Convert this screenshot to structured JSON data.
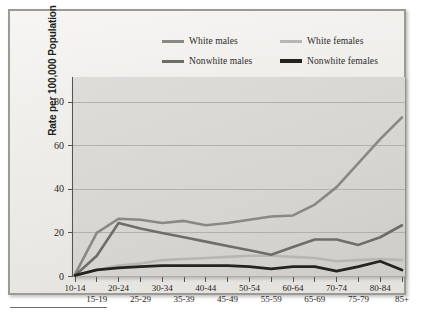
{
  "figure": {
    "y_axis_title": "Rate per 100,000 Population",
    "y_ticks": [
      "0",
      "20",
      "40",
      "60",
      "80"
    ],
    "colors": {
      "white_males": "#8a8885",
      "white_females": "#b8b6b2",
      "nonwhite_males": "#6f6d6a",
      "nonwhite_females": "#24231f",
      "plot_background": "#d6d4d0",
      "panel_background": "#eceae6",
      "panel_border": "#9b9a97",
      "gridline": "#a9a7a3",
      "axis": "#55534f",
      "text": "#272624"
    }
  },
  "legend": {
    "entries": [
      {
        "label": "White males",
        "color": "#8a8885",
        "width": 3.2
      },
      {
        "label": "White females",
        "color": "#b8b6b2",
        "width": 3.2
      },
      {
        "label": "Nonwhite males",
        "color": "#6f6d6a",
        "width": 3.4
      },
      {
        "label": "Nonwhite females",
        "color": "#24231f",
        "width": 4.0
      }
    ]
  },
  "chart_data": {
    "type": "line",
    "title": "",
    "xlabel": "",
    "ylabel": "Rate per 100,000 Population",
    "ylim": [
      0,
      86
    ],
    "yticks": [
      0,
      20,
      40,
      60,
      80
    ],
    "grid": true,
    "legend_position": "top-center",
    "categories": [
      "10-14",
      "15-19",
      "20-24",
      "25-29",
      "30-34",
      "35-39",
      "40-44",
      "45-49",
      "50-54",
      "55-59",
      "60-64",
      "65-69",
      "70-74",
      "75-79",
      "80-84",
      "85+"
    ],
    "series": [
      {
        "name": "White males",
        "color": "#8a8885",
        "values": [
          1,
          20,
          26.5,
          26,
          24.5,
          25.5,
          23.5,
          24.5,
          26,
          27.5,
          28,
          33,
          41,
          52,
          63,
          73
        ]
      },
      {
        "name": "White females",
        "color": "#b8b6b2",
        "values": [
          0.5,
          3,
          5,
          6,
          7.5,
          8,
          8.5,
          9,
          9.5,
          9.5,
          9,
          8.5,
          7,
          7.5,
          8,
          7.5
        ]
      },
      {
        "name": "Nonwhite males",
        "color": "#6f6d6a",
        "values": [
          0.5,
          9.5,
          24.5,
          22,
          20,
          18,
          16,
          14,
          12,
          10,
          13.5,
          17,
          17,
          14.5,
          18,
          23.5
        ]
      },
      {
        "name": "Nonwhite females",
        "color": "#24231f",
        "values": [
          0.5,
          3,
          4,
          4.5,
          5,
          5,
          5,
          5,
          4.5,
          3.5,
          4.5,
          4.5,
          2.5,
          4.5,
          7,
          3
        ]
      }
    ]
  }
}
